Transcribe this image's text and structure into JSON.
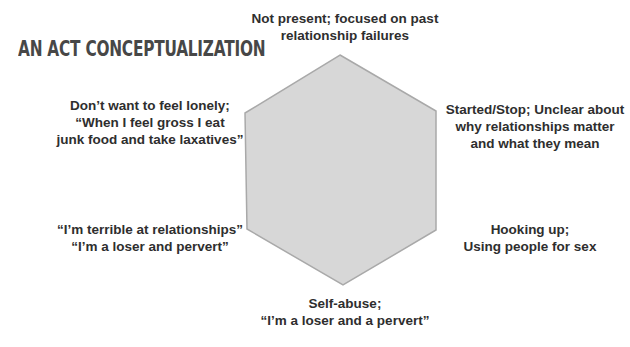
{
  "title": "AN ACT CONCEPTUALIZATION",
  "hexagon": {
    "fill": "#d7d7d7",
    "stroke": "#a9a9a9",
    "points": "340,55 436,111 436,230 343,285 247,229 245,113"
  },
  "labels": {
    "top": {
      "position": "top",
      "lines": [
        "Not present; focused on past",
        "relationship failures"
      ]
    },
    "upper_right": {
      "position": "upper-right",
      "lines": [
        "Started/Stop; Unclear about",
        "why relationships matter",
        "and what they mean"
      ]
    },
    "lower_right": {
      "position": "lower-right",
      "lines": [
        "Hooking up;",
        "Using people for sex"
      ]
    },
    "bottom": {
      "position": "bottom",
      "lines": [
        "Self-abuse;",
        "“I’m a loser and a pervert”"
      ]
    },
    "lower_left": {
      "position": "lower-left",
      "lines": [
        "“I’m terrible at relationships”",
        "“I’m a loser and pervert”"
      ]
    },
    "upper_left": {
      "position": "upper-left",
      "lines": [
        "Don’t want to feel lonely;",
        "“When I feel gross I eat",
        "junk food and take laxatives”"
      ]
    }
  }
}
